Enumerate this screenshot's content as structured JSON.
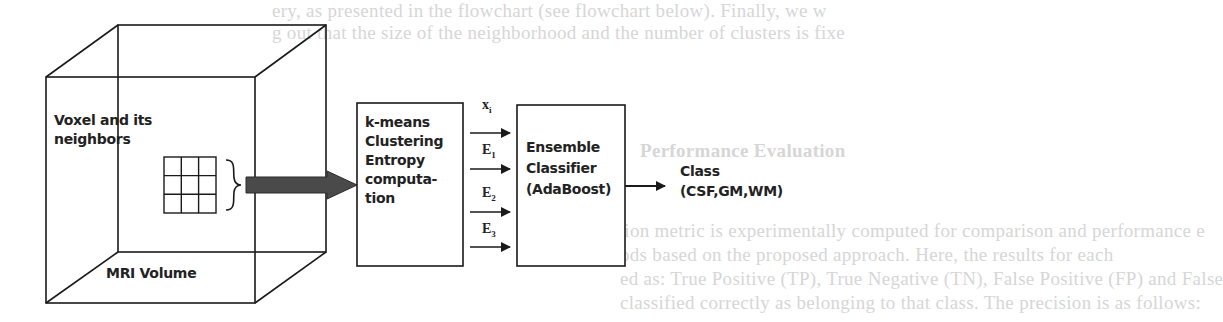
{
  "bleed_through_text": [
    "ery, as presented in the flowchart (see flowchart below). Finally, we w",
    "g out that the size of the neighborhood and the number of clusters is fixe",
    "",
    "",
    "Performance Evaluation",
    "",
    "ation metric is experimentally computed for comparison and performance e",
    "ods based on the proposed approach. Here, the results for each",
    "ed as: True Positive (TP), True Negative (TN), False Positive (FP) and False",
    "classified correctly as belonging to that class. The precision is as follows:"
  ],
  "diagram": {
    "volume": {
      "title": "MRI Volume",
      "voxel_label": "Voxel and its neighbors"
    },
    "kmeans_box": {
      "lines": [
        "k-means",
        "Clustering",
        "Entropy",
        "computa-",
        "tion"
      ]
    },
    "features": [
      {
        "symbol": "x",
        "sub": "i"
      },
      {
        "symbol": "E",
        "sub": "1"
      },
      {
        "symbol": "E",
        "sub": "2"
      },
      {
        "symbol": "E",
        "sub": "3"
      }
    ],
    "classifier_box": {
      "lines": [
        "Ensemble",
        "Classifier",
        "(AdaBoost)"
      ]
    },
    "output": {
      "lines": [
        "Class",
        "(CSF,GM,WM)"
      ]
    },
    "colors": {
      "stroke": "#1a1a1a",
      "big_arrow": "#4a4a4a",
      "bleed": "#d6d6d6"
    }
  }
}
